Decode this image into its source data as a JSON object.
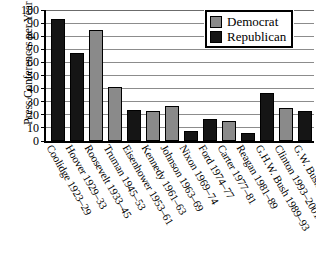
{
  "chart_data": {
    "type": "bar",
    "title": "",
    "xlabel": "",
    "ylabel": "Press Conferences per Year",
    "ylim": [
      0,
      100
    ],
    "ytick_step": 10,
    "grid": true,
    "legend_position": "top-right",
    "categories": [
      "Coolidge 1923–29",
      "Hoover 1929–33",
      "Roosevelt 1933–45",
      "Truman 1945–53",
      "Eisenhower 1953–61",
      "Kennedy 1961–63",
      "Johnson 1963–69",
      "Nixon 1969–74",
      "Ford 1974–77",
      "Carter 1977–81",
      "Reagan 1981–89",
      "G.H.W. Bush 1989–93",
      "Clinton 1993–2001",
      "G.W. Bush 2001–04"
    ],
    "values": [
      93,
      67,
      85,
      41,
      24,
      23,
      27,
      8,
      17,
      15,
      6,
      37,
      25,
      23
    ],
    "parties": [
      "Republican",
      "Republican",
      "Democrat",
      "Democrat",
      "Republican",
      "Democrat",
      "Democrat",
      "Republican",
      "Republican",
      "Democrat",
      "Republican",
      "Republican",
      "Democrat",
      "Republican"
    ],
    "ytick_labels": [
      "100",
      "90",
      "80",
      "70",
      "60",
      "50",
      "40",
      "30",
      "20",
      "10",
      "0"
    ],
    "series": [
      {
        "name": "Democrat",
        "color": "#8a8a8a",
        "points": [
          {
            "category": "Roosevelt 1933–45",
            "value": 85
          },
          {
            "category": "Truman 1945–53",
            "value": 41
          },
          {
            "category": "Kennedy 1961–63",
            "value": 23
          },
          {
            "category": "Johnson 1963–69",
            "value": 27
          },
          {
            "category": "Carter 1977–81",
            "value": 15
          },
          {
            "category": "Clinton 1993–2001",
            "value": 25
          }
        ]
      },
      {
        "name": "Republican",
        "color": "#151515",
        "points": [
          {
            "category": "Coolidge 1923–29",
            "value": 93
          },
          {
            "category": "Hoover 1929–33",
            "value": 67
          },
          {
            "category": "Eisenhower 1953–61",
            "value": 24
          },
          {
            "category": "Nixon 1969–74",
            "value": 8
          },
          {
            "category": "Ford 1974–77",
            "value": 17
          },
          {
            "category": "Reagan 1981–89",
            "value": 6
          },
          {
            "category": "G.H.W. Bush 1989–93",
            "value": 37
          },
          {
            "category": "G.W. Bush 2001–04",
            "value": 23
          }
        ]
      }
    ]
  },
  "legend": {
    "items": [
      {
        "label": "Democrat",
        "key": "dem"
      },
      {
        "label": "Republican",
        "key": "rep"
      }
    ]
  }
}
